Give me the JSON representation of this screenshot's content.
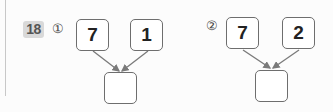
{
  "problem": {
    "number": "18",
    "parts": [
      {
        "marker": "①",
        "top_left": "7",
        "top_right": "1",
        "answer": ""
      },
      {
        "marker": "②",
        "top_left": "7",
        "top_right": "2",
        "answer": ""
      }
    ]
  },
  "colors": {
    "box_border": "#6e6e6e",
    "arrow": "#7a7a7a",
    "badge_bg": "#d9d9d9"
  }
}
